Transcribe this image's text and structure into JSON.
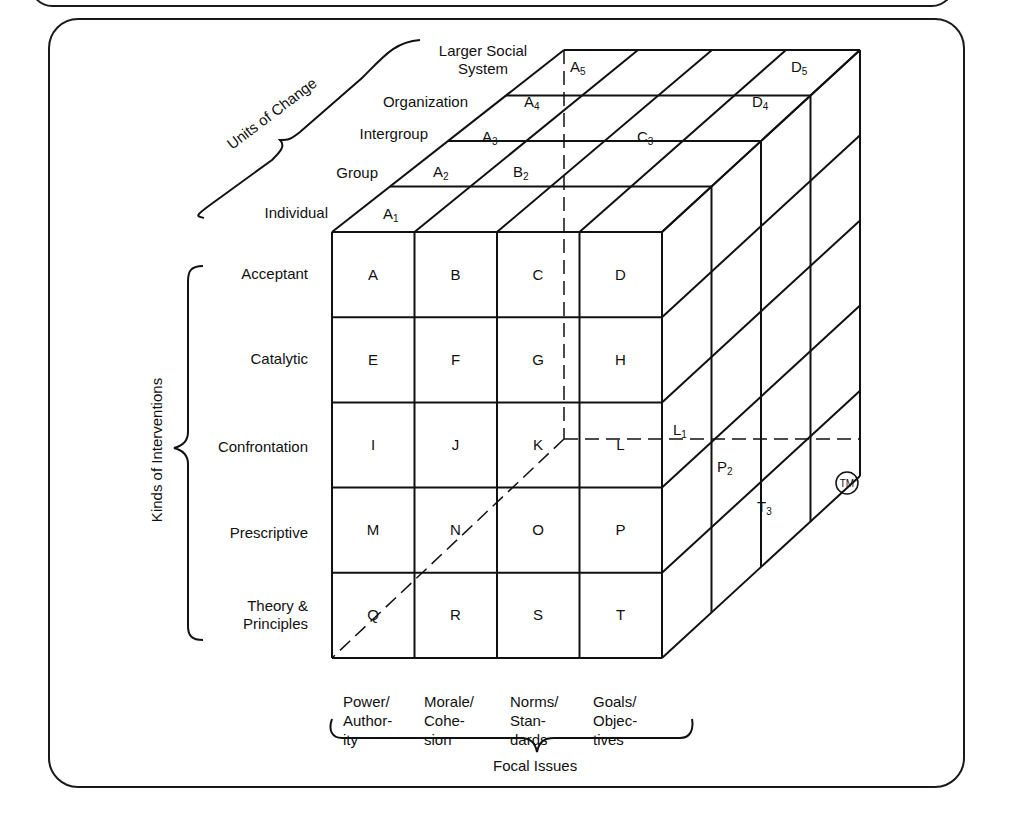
{
  "figure": {
    "axis_units": {
      "title": "Units of Change",
      "levels": [
        "Individual",
        "Group",
        "Intergroup",
        "Organization",
        "Larger Social System"
      ],
      "levels_display": {
        "individual": "Individual",
        "group": "Group",
        "intergroup": "Intergroup",
        "organization": "Organization",
        "larger_1": "Larger Social",
        "larger_2": "System"
      }
    },
    "axis_interventions": {
      "title": "Kinds of Interventions",
      "rows": [
        "Acceptant",
        "Catalytic",
        "Confrontation",
        "Prescriptive",
        "Theory & Principles"
      ],
      "rows_display": {
        "acceptant": "Acceptant",
        "catalytic": "Catalytic",
        "confrontation": "Confrontation",
        "prescriptive": "Prescriptive",
        "theory_1": "Theory &",
        "theory_2": "Principles"
      }
    },
    "axis_focal": {
      "title": "Focal Issues",
      "columns": [
        {
          "l1": "Power/",
          "l2": "Author-",
          "l3": "ity"
        },
        {
          "l1": "Morale/",
          "l2": "Cohe-",
          "l3": "sion"
        },
        {
          "l1": "Norms/",
          "l2": "Stan-",
          "l3": "dards"
        },
        {
          "l1": "Goals/",
          "l2": "Objec-",
          "l3": "tives"
        }
      ]
    },
    "front_cells": [
      [
        "A",
        "B",
        "C",
        "D"
      ],
      [
        "E",
        "F",
        "G",
        "H"
      ],
      [
        "I",
        "J",
        "K",
        "L"
      ],
      [
        "M",
        "N",
        "O",
        "P"
      ],
      [
        "Q",
        "R",
        "S",
        "T"
      ]
    ],
    "top_labels": {
      "a1": {
        "base": "A",
        "sub": "1"
      },
      "a2": {
        "base": "A",
        "sub": "2"
      },
      "b2": {
        "base": "B",
        "sub": "2"
      },
      "a3": {
        "base": "A",
        "sub": "3"
      },
      "c3": {
        "base": "C",
        "sub": "3"
      },
      "a4": {
        "base": "A",
        "sub": "4"
      },
      "d4": {
        "base": "D",
        "sub": "4"
      },
      "a5": {
        "base": "A",
        "sub": "5"
      },
      "d5": {
        "base": "D",
        "sub": "5"
      }
    },
    "side_labels": {
      "l1": {
        "base": "L",
        "sub": "1"
      },
      "p2": {
        "base": "P",
        "sub": "2"
      },
      "t3": {
        "base": "T",
        "sub": "3"
      }
    },
    "trademark": "TM"
  }
}
